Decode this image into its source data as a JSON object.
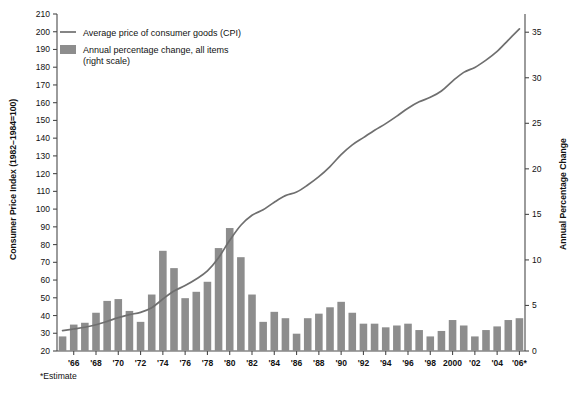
{
  "chart_data": {
    "type": "bar",
    "title": "",
    "subtitle": "",
    "xlabel": "",
    "ylabel": "Consumer Price Index (1982–1984=100)",
    "y2label": "Annual Percentage Change",
    "ylim": [
      20,
      210
    ],
    "y2lim": [
      0,
      37
    ],
    "grid": false,
    "legend_position": "top-left",
    "footnote": "*Estimate",
    "yticks": [
      20,
      30,
      40,
      50,
      60,
      70,
      80,
      90,
      100,
      110,
      120,
      130,
      140,
      150,
      160,
      170,
      180,
      190,
      200,
      210
    ],
    "y2ticks": [
      0,
      5,
      10,
      15,
      20,
      25,
      30,
      35
    ],
    "xticklabels": [
      "'66",
      "'68",
      "'70",
      "'72",
      "'74",
      "'76",
      "'78",
      "'80",
      "'82",
      "'84",
      "'86",
      "'88",
      "'90",
      "'92",
      "'94",
      "'96",
      "'98",
      "2000",
      "'02",
      "'04",
      "'06*"
    ],
    "xtickyears": [
      1966,
      1968,
      1970,
      1972,
      1974,
      1976,
      1978,
      1980,
      1982,
      1984,
      1986,
      1988,
      1990,
      1992,
      1994,
      1996,
      1998,
      2000,
      2002,
      2004,
      2006
    ],
    "x": [
      1965,
      1966,
      1967,
      1968,
      1969,
      1970,
      1971,
      1972,
      1973,
      1974,
      1975,
      1976,
      1977,
      1978,
      1979,
      1980,
      1981,
      1982,
      1983,
      1984,
      1985,
      1986,
      1987,
      1988,
      1989,
      1990,
      1991,
      1992,
      1993,
      1994,
      1995,
      1996,
      1997,
      1998,
      1999,
      2000,
      2001,
      2002,
      2003,
      2004,
      2005,
      2006
    ],
    "series": [
      {
        "name": "Average price of consumer goods (CPI)",
        "type": "line",
        "axis": "left",
        "color": "#6f6f6f",
        "values": [
          31.5,
          32.4,
          33.4,
          34.8,
          36.7,
          38.8,
          40.5,
          41.8,
          44.4,
          49.3,
          53.8,
          56.9,
          60.6,
          65.2,
          72.6,
          82.4,
          90.9,
          96.5,
          99.6,
          103.9,
          107.6,
          109.6,
          113.6,
          118.3,
          124.0,
          130.7,
          136.2,
          140.3,
          144.5,
          148.2,
          152.4,
          156.9,
          160.5,
          163.0,
          166.6,
          172.2,
          177.1,
          179.9,
          184.0,
          188.9,
          195.3,
          201.6
        ]
      },
      {
        "name": "Annual percentage change, all items (right scale)",
        "type": "bar",
        "axis": "right",
        "color": "#8d8d8d",
        "values": [
          1.6,
          2.9,
          3.1,
          4.2,
          5.5,
          5.7,
          4.4,
          3.2,
          6.2,
          11.0,
          9.1,
          5.8,
          6.5,
          7.6,
          11.3,
          13.5,
          10.3,
          6.2,
          3.2,
          4.3,
          3.6,
          1.9,
          3.6,
          4.1,
          4.8,
          5.4,
          4.2,
          3.0,
          3.0,
          2.6,
          2.8,
          3.0,
          2.3,
          1.6,
          2.2,
          3.4,
          2.8,
          1.6,
          2.3,
          2.7,
          3.4,
          3.6
        ]
      }
    ]
  },
  "legend": {
    "items": [
      {
        "label": "Average price of consumer goods (CPI)",
        "marker": "line"
      },
      {
        "label": "Annual percentage change, all items",
        "label2": "(right scale)",
        "marker": "swatch"
      }
    ]
  },
  "colors": {
    "bar": "#8d8d8d",
    "line": "#6f6f6f",
    "axis": "#4a4a4a",
    "text": "#111111",
    "background": "#ffffff"
  }
}
